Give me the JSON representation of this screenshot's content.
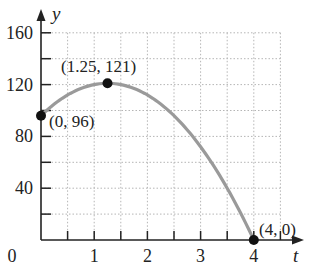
{
  "chart_data": {
    "type": "line",
    "title": "",
    "xlabel": "t",
    "ylabel": "y",
    "xlim": [
      0,
      4.5
    ],
    "ylim": [
      0,
      165
    ],
    "grid": true,
    "grid_style": "dotted",
    "x_ticks": [
      "0",
      "1",
      "2",
      "3",
      "4"
    ],
    "y_ticks": [
      "40",
      "80",
      "120",
      "160"
    ],
    "x_minor_step": 0.5,
    "y_minor_step": 20,
    "series": [
      {
        "name": "y = -16t^2 + 40t + 96",
        "x": [
          0,
          0.5,
          1,
          1.25,
          1.5,
          2,
          2.5,
          3,
          3.5,
          4
        ],
        "values": [
          96,
          112,
          120,
          121,
          120,
          112,
          96,
          72,
          40,
          0
        ],
        "color": "#9a9a9a"
      }
    ],
    "points": [
      {
        "x": 0,
        "y": 96,
        "label": "(0, 96)"
      },
      {
        "x": 1.25,
        "y": 121,
        "label": "(1.25, 121)"
      },
      {
        "x": 4,
        "y": 0,
        "label": "(4, 0)"
      }
    ],
    "colors": {
      "curve": "#9a9a9a",
      "axis": "#222222",
      "grid": "#b5b5b5",
      "point": "#111111"
    }
  }
}
